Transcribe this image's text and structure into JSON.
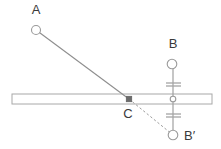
{
  "diagram": {
    "background_color": "#ffffff",
    "stroke_color": "#9a9a9a",
    "label_color": "#3a3a3a",
    "accent_color": "#6b6b6b",
    "labels": {
      "a": "A",
      "b": "B",
      "c": "C",
      "b_prime": "B′"
    }
  },
  "chart_data": {
    "type": "scatter",
    "xlabel": "",
    "ylabel": "",
    "xlim": [
      0,
      221
    ],
    "ylim": [
      0,
      149
    ],
    "grid": false,
    "legend": "none",
    "points": [
      {
        "name": "A",
        "label": "A",
        "x": 36,
        "y": 30,
        "marker": "open-circle",
        "radius": 4.5,
        "label_x": 36,
        "label_y": 14
      },
      {
        "name": "B",
        "label": "B",
        "x": 172,
        "y": 64,
        "marker": "open-circle",
        "radius": 4.8,
        "label_x": 173,
        "label_y": 48
      },
      {
        "name": "C",
        "label": "C",
        "x": 129,
        "y": 99,
        "marker": "filled-square",
        "radius": 2.6,
        "label_x": 128,
        "label_y": 118
      },
      {
        "name": "B-prime",
        "label": "B′",
        "x": 173,
        "y": 135,
        "marker": "open-circle",
        "radius": 4.8,
        "label_x": 184,
        "label_y": 140
      },
      {
        "name": "pivot",
        "label": "",
        "x": 173,
        "y": 99,
        "marker": "open-circle",
        "radius": 2.8,
        "label_x": 0,
        "label_y": 0
      }
    ],
    "segments": [
      {
        "name": "A-to-C",
        "style": "solid",
        "x1": 36,
        "y1": 30,
        "x2": 129,
        "y2": 99
      },
      {
        "name": "C-to-B-prime",
        "style": "dashed",
        "x1": 129,
        "y1": 99,
        "x2": 173,
        "y2": 135
      },
      {
        "name": "B-to-pivot",
        "style": "solid",
        "x1": 173,
        "y1": 69,
        "x2": 173,
        "y2": 96
      },
      {
        "name": "pivot-to-B-prime",
        "style": "solid",
        "x1": 173,
        "y1": 102,
        "x2": 173,
        "y2": 130
      }
    ],
    "bar": {
      "name": "horizontal-lever-bar",
      "x": 12,
      "y": 94,
      "width": 200,
      "height": 10
    },
    "ticks": [
      {
        "name": "upper-tick-1",
        "x1": 166,
        "y1": 83,
        "x2": 181,
        "y2": 83
      },
      {
        "name": "upper-tick-2",
        "x1": 166,
        "y1": 86,
        "x2": 181,
        "y2": 86
      },
      {
        "name": "lower-tick-1",
        "x1": 166,
        "y1": 114,
        "x2": 181,
        "y2": 114
      },
      {
        "name": "lower-tick-2",
        "x1": 166,
        "y1": 117,
        "x2": 181,
        "y2": 117
      }
    ]
  }
}
